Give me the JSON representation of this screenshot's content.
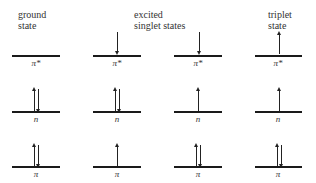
{
  "headers": {
    "ground": {
      "line1": "ground",
      "line2": "state"
    },
    "excited": {
      "line1": "excited",
      "line2": "singlet states"
    },
    "triplet": {
      "line1": "triplet",
      "line2": "state"
    }
  },
  "levels": {
    "pi_star": "π*",
    "n": "n",
    "pi": "π"
  },
  "columns": [
    {
      "name": "ground state",
      "pi_star": "",
      "n": "up-down",
      "pi": "up-down"
    },
    {
      "name": "excited singlet (n→π*)",
      "pi_star": "down",
      "n": "up-down",
      "pi": "up"
    },
    {
      "name": "excited singlet (π→π*)",
      "pi_star": "down",
      "n": "up",
      "pi": "up-down"
    },
    {
      "name": "triplet state",
      "pi_star": "up",
      "n": "up",
      "pi": "up-down"
    }
  ]
}
